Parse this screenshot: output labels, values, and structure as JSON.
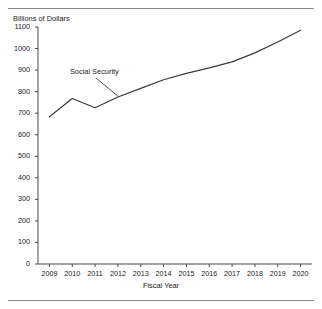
{
  "figure": {
    "clipped_header_text": "",
    "rules": {
      "color": "#8a8a8a"
    }
  },
  "annotation": {
    "label": "Social Security"
  },
  "chart_data": {
    "type": "line",
    "title": "",
    "xlabel": "Fiscal Year",
    "ylabel": "Billions of Dollars",
    "x": [
      2009,
      2010,
      2011,
      2012,
      2013,
      2014,
      2015,
      2016,
      2017,
      2018,
      2019,
      2020
    ],
    "categories": [
      "2009",
      "2010",
      "2011",
      "2012",
      "2013",
      "2014",
      "2015",
      "2016",
      "2017",
      "2018",
      "2019",
      "2020"
    ],
    "values": [
      683,
      768,
      725,
      775,
      815,
      855,
      885,
      910,
      938,
      980,
      1030,
      1085
    ],
    "series": [
      {
        "name": "Social Security",
        "values": [
          683,
          768,
          725,
          775,
          815,
          855,
          885,
          910,
          938,
          980,
          1030,
          1085
        ]
      }
    ],
    "ylim": [
      0,
      1100
    ],
    "yticks": [
      0,
      100,
      200,
      300,
      400,
      500,
      600,
      700,
      800,
      900,
      1000,
      1100
    ],
    "ytick_labels": [
      "0",
      "100",
      "200",
      "300",
      "400",
      "500",
      "600",
      "700",
      "800",
      "900",
      "1000",
      "1100"
    ],
    "xtick_labels": [
      "2009",
      "2010",
      "2011",
      "2012",
      "2013",
      "2014",
      "2015",
      "2016",
      "2017",
      "2018",
      "2019",
      "2020"
    ],
    "grid": false,
    "legend": null,
    "line_color": "#3a3a3a",
    "axis_color": "#4a4a4a",
    "annotations": [
      {
        "text": "Social Security",
        "points_to_year": 2012
      }
    ]
  },
  "plot_geometry": {
    "left": 38,
    "right": 312,
    "top": 27,
    "bottom": 264
  }
}
